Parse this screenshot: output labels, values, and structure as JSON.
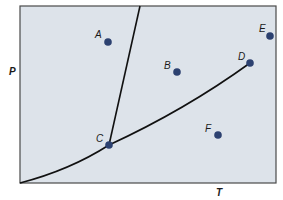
{
  "diagram": {
    "type": "phase-diagram",
    "axes": {
      "x_label": "T",
      "y_label": "P"
    },
    "colors": {
      "background": "#dde3ea",
      "frame": "#4a4a4a",
      "curve": "#111111",
      "point": "#2c4170"
    },
    "points": [
      {
        "label": "A",
        "x": 108,
        "y": 42
      },
      {
        "label": "B",
        "x": 177,
        "y": 72
      },
      {
        "label": "C",
        "x": 109,
        "y": 145
      },
      {
        "label": "D",
        "x": 250,
        "y": 63
      },
      {
        "label": "E",
        "x": 270,
        "y": 36
      },
      {
        "label": "F",
        "x": 218,
        "y": 135
      }
    ]
  }
}
